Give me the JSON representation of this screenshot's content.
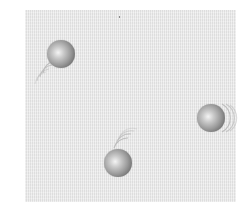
{
  "diagram": {
    "container": {
      "x": 25,
      "y": 10,
      "width": 211,
      "height": 192,
      "fill": "#e9e9e9"
    },
    "particles": [
      {
        "id": "particle-1",
        "cx": 61,
        "cy": 54,
        "r": 14,
        "trail_direction": "lower-left"
      },
      {
        "id": "particle-2",
        "cx": 211,
        "cy": 118,
        "r": 14,
        "trail_direction": "right"
      },
      {
        "id": "particle-3",
        "cx": 118,
        "cy": 163,
        "r": 14,
        "trail_direction": "upper-right"
      }
    ],
    "colors": {
      "sphere_highlight": "#f4f4f4",
      "sphere_shadow": "#5a5a5a",
      "trail": "#b8b8b8"
    }
  }
}
